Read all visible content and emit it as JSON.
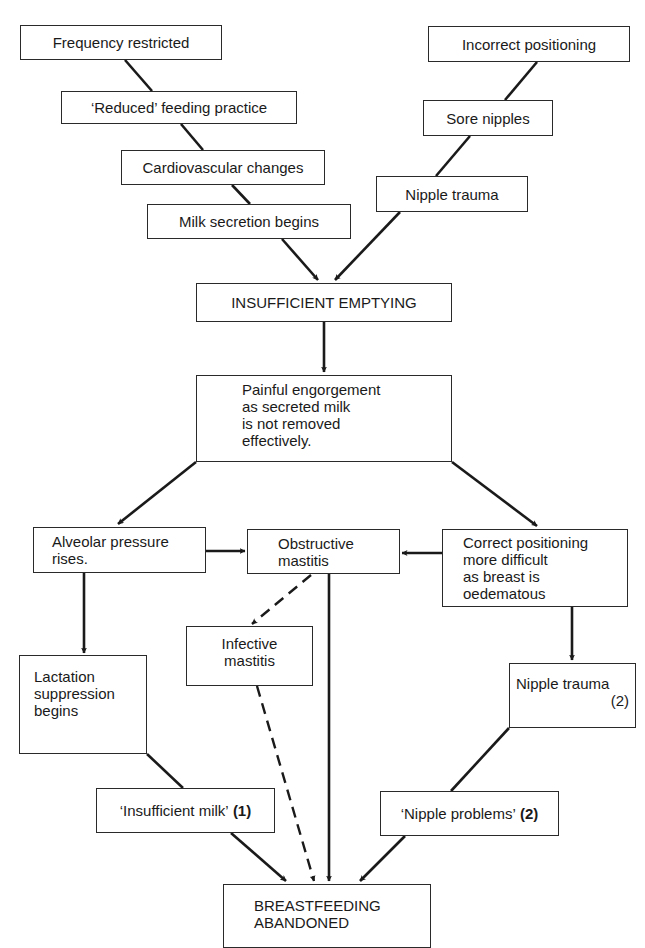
{
  "diagram": {
    "type": "flowchart",
    "nodes": {
      "frequency_restricted": "Frequency restricted",
      "reduced_feeding": "‘Reduced’ feeding practice",
      "cardiovascular_changes": "Cardiovascular changes",
      "milk_secretion": "Milk secretion begins",
      "incorrect_positioning": "Incorrect positioning",
      "sore_nipples": "Sore nipples",
      "nipple_trauma_top": "Nipple trauma",
      "insufficient_emptying": "INSUFFICIENT EMPTYING",
      "painful_engorgement": [
        "Painful engorgement",
        "as secreted milk",
        "is not removed",
        "effectively."
      ],
      "alveolar_pressure": [
        "Alveolar pressure",
        "rises."
      ],
      "obstructive_mastitis": [
        "Obstructive",
        "mastitis"
      ],
      "correct_positioning": [
        "Correct positioning",
        "more difficult",
        "as breast is",
        "oedematous"
      ],
      "infective_mastitis": [
        "Infective",
        "mastitis"
      ],
      "lactation_suppression": [
        "Lactation",
        "suppression",
        "begins"
      ],
      "nipple_trauma_bottom": "Nipple trauma",
      "nipple_trauma_bottom_note": "(2)",
      "insufficient_milk": "‘Insufficient milk’",
      "insufficient_milk_note": "(1)",
      "nipple_problems": "‘Nipple problems’",
      "nipple_problems_note": "(2)",
      "breastfeeding_abandoned": [
        "BREASTFEEDING",
        "ABANDONED"
      ]
    },
    "edges": [
      {
        "from": "frequency_restricted",
        "to": "reduced_feeding",
        "style": "solid"
      },
      {
        "from": "reduced_feeding",
        "to": "cardiovascular_changes",
        "style": "solid"
      },
      {
        "from": "cardiovascular_changes",
        "to": "milk_secretion",
        "style": "solid"
      },
      {
        "from": "milk_secretion",
        "to": "insufficient_emptying",
        "style": "arrow"
      },
      {
        "from": "incorrect_positioning",
        "to": "sore_nipples",
        "style": "solid"
      },
      {
        "from": "sore_nipples",
        "to": "nipple_trauma_top",
        "style": "solid"
      },
      {
        "from": "nipple_trauma_top",
        "to": "insufficient_emptying",
        "style": "arrow"
      },
      {
        "from": "insufficient_emptying",
        "to": "painful_engorgement",
        "style": "arrow"
      },
      {
        "from": "painful_engorgement",
        "to": "alveolar_pressure",
        "style": "arrow"
      },
      {
        "from": "painful_engorgement",
        "to": "correct_positioning",
        "style": "arrow"
      },
      {
        "from": "alveolar_pressure",
        "to": "obstructive_mastitis",
        "style": "arrow"
      },
      {
        "from": "correct_positioning",
        "to": "obstructive_mastitis",
        "style": "arrow"
      },
      {
        "from": "alveolar_pressure",
        "to": "lactation_suppression",
        "style": "arrow"
      },
      {
        "from": "obstructive_mastitis",
        "to": "infective_mastitis",
        "style": "dashed-arrow"
      },
      {
        "from": "correct_positioning",
        "to": "nipple_trauma_bottom",
        "style": "arrow"
      },
      {
        "from": "lactation_suppression",
        "to": "insufficient_milk",
        "style": "solid"
      },
      {
        "from": "nipple_trauma_bottom",
        "to": "nipple_problems",
        "style": "solid"
      },
      {
        "from": "insufficient_milk",
        "to": "breastfeeding_abandoned",
        "style": "arrow"
      },
      {
        "from": "infective_mastitis",
        "to": "breastfeeding_abandoned",
        "style": "dashed-arrow"
      },
      {
        "from": "obstructive_mastitis",
        "to": "breastfeeding_abandoned",
        "style": "arrow"
      },
      {
        "from": "nipple_problems",
        "to": "breastfeeding_abandoned",
        "style": "arrow"
      }
    ]
  }
}
